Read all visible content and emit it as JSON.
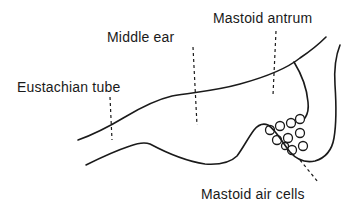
{
  "diagram": {
    "labels": {
      "eustachian_tube": "Eustachian tube",
      "middle_ear": "Middle ear",
      "mastoid_antrum": "Mastoid antrum",
      "mastoid_air_cells": "Mastoid air cells"
    },
    "colors": {
      "ink": "#1a1a1a",
      "background": "#ffffff"
    }
  }
}
